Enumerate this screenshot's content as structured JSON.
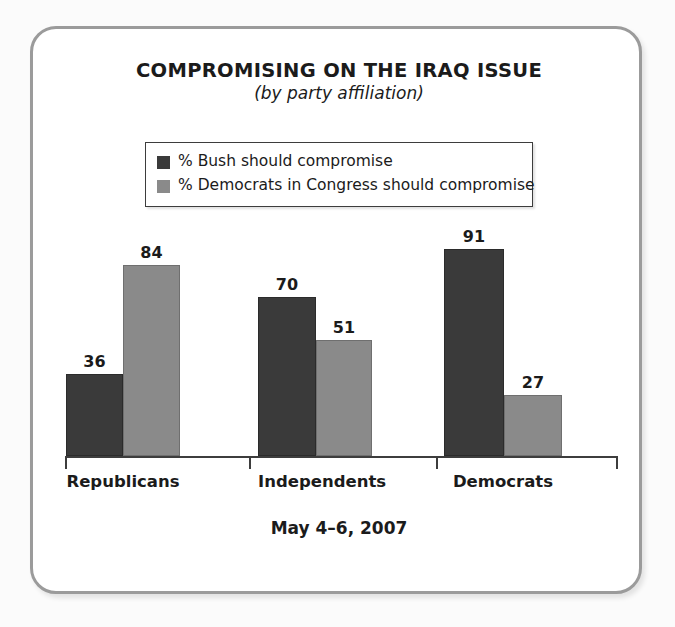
{
  "frame": {
    "border_color": "#9b9b9b",
    "background": "#ffffff"
  },
  "header": {
    "title": "COMPROMISING ON THE IRAQ ISSUE",
    "subtitle": "(by party affiliation)"
  },
  "footer": {
    "date": "May 4–6, 2007"
  },
  "legend": {
    "position": "top-center",
    "entries": [
      {
        "label": "% Bush should compromise",
        "color": "#3a3a3a"
      },
      {
        "label": "% Democrats in Congress should compromise",
        "color": "#8a8a8a"
      }
    ]
  },
  "chart_data": {
    "type": "bar",
    "title": "COMPROMISING ON THE IRAQ ISSUE",
    "subtitle": "(by party affiliation)",
    "xlabel": "",
    "ylabel": "",
    "ylim": [
      0,
      100
    ],
    "grid": false,
    "legend_position": "top-center",
    "annotation": "May 4–6, 2007",
    "categories": [
      "Republicans",
      "Independents",
      "Democrats"
    ],
    "series": [
      {
        "name": "% Bush should compromise",
        "color": "#3a3a3a",
        "values": [
          36,
          70,
          91
        ]
      },
      {
        "name": "% Democrats in Congress should compromise",
        "color": "#8a8a8a",
        "values": [
          84,
          51,
          27
        ]
      }
    ],
    "data_labels": [
      {
        "category": "Republicans",
        "bush": 36,
        "democrats": 84
      },
      {
        "category": "Independents",
        "bush": 70,
        "democrats": 51
      },
      {
        "category": "Democrats",
        "bush": 91,
        "democrats": 27
      }
    ]
  },
  "scale": {
    "px_per_unit": 2.275
  }
}
